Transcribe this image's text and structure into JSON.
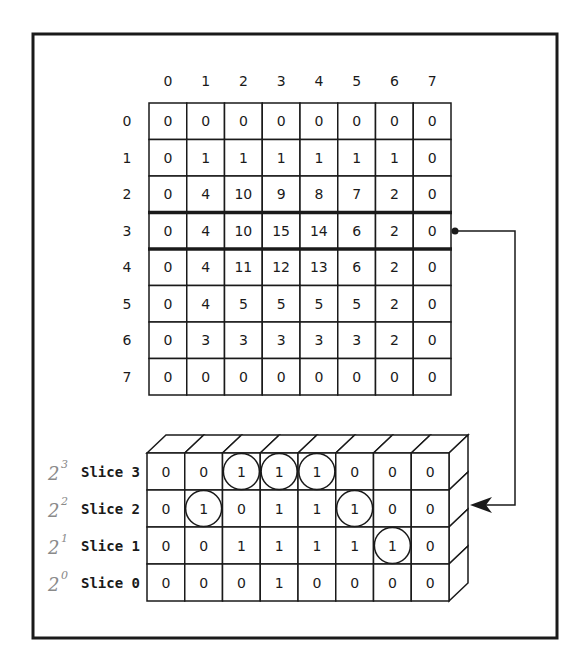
{
  "colors": {
    "ink": "#1a1a1a",
    "pencil": "#8a8a8a",
    "background": "#ffffff"
  },
  "grid": {
    "column_headers": [
      "0",
      "1",
      "2",
      "3",
      "4",
      "5",
      "6",
      "7"
    ],
    "row_headers": [
      "0",
      "1",
      "2",
      "3",
      "4",
      "5",
      "6",
      "7"
    ],
    "highlighted_row": 3,
    "values": [
      [
        0,
        0,
        0,
        0,
        0,
        0,
        0,
        0
      ],
      [
        0,
        1,
        1,
        1,
        1,
        1,
        1,
        0
      ],
      [
        0,
        4,
        10,
        9,
        8,
        7,
        2,
        0
      ],
      [
        0,
        4,
        10,
        15,
        14,
        6,
        2,
        0
      ],
      [
        0,
        4,
        11,
        12,
        13,
        6,
        2,
        0
      ],
      [
        0,
        4,
        5,
        5,
        5,
        5,
        2,
        0
      ],
      [
        0,
        3,
        3,
        3,
        3,
        3,
        2,
        0
      ],
      [
        0,
        0,
        0,
        0,
        0,
        0,
        0,
        0
      ]
    ]
  },
  "slices": {
    "rows": [
      {
        "label": "Slice 3",
        "annotation_base": "2",
        "annotation_exp": "3",
        "bits": [
          0,
          0,
          1,
          1,
          1,
          0,
          0,
          0
        ],
        "circled": [
          2,
          3,
          4
        ]
      },
      {
        "label": "Slice 2",
        "annotation_base": "2",
        "annotation_exp": "2",
        "bits": [
          0,
          1,
          0,
          1,
          1,
          1,
          0,
          0
        ],
        "circled": [
          1,
          5
        ]
      },
      {
        "label": "Slice 1",
        "annotation_base": "2",
        "annotation_exp": "1",
        "bits": [
          0,
          0,
          1,
          1,
          1,
          1,
          1,
          0
        ],
        "circled": [
          6
        ]
      },
      {
        "label": "Slice 0",
        "annotation_base": "2",
        "annotation_exp": "0",
        "bits": [
          0,
          0,
          0,
          1,
          0,
          0,
          0,
          0
        ],
        "circled": []
      }
    ]
  },
  "connector": {
    "from": "grid-row-3-end",
    "to": "slice-stack-right-side",
    "arrowhead": "left-arrow"
  }
}
